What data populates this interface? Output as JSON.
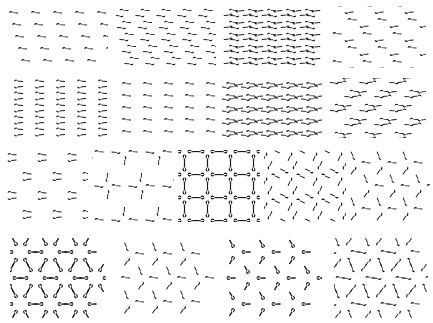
{
  "figure": {
    "title": "",
    "background_color": "#ffffff",
    "ink_color": "#111111",
    "width": 433,
    "height": 323,
    "rows": 4,
    "glyph": {
      "name": "comma-teardrop",
      "head_radius": 1.9,
      "tail_length": 7.0,
      "tail_width": 0.9
    }
  },
  "panels": [
    {
      "id": "p1",
      "name": "panel-p1",
      "label": "p1",
      "row": 0,
      "col": 0,
      "x": 8,
      "y": 6,
      "w": 100,
      "h": 62,
      "lattice": "oblique",
      "cell_w": 22,
      "cell_h": 12,
      "shear": 6,
      "cols": 5,
      "rows": 5,
      "motif": [
        {
          "x": 0,
          "y": 0,
          "rot": 0,
          "flip": 1
        }
      ]
    },
    {
      "id": "p2",
      "name": "panel-p2",
      "label": "p2",
      "row": 0,
      "col": 1,
      "x": 116,
      "y": 6,
      "w": 100,
      "h": 62,
      "lattice": "oblique",
      "cell_w": 21,
      "cell_h": 12,
      "shear": 5,
      "cols": 5,
      "rows": 5,
      "motif": [
        {
          "x": 0,
          "y": -2.4,
          "rot": 0,
          "flip": 1
        },
        {
          "x": 0,
          "y": 2.4,
          "rot": 180,
          "flip": 1
        }
      ]
    },
    {
      "id": "pm",
      "name": "panel-pm",
      "label": "pm",
      "row": 0,
      "col": 2,
      "x": 222,
      "y": 6,
      "w": 100,
      "h": 62,
      "lattice": "rect",
      "cell_w": 19,
      "cell_h": 12,
      "shear": 0,
      "cols": 5,
      "rows": 5,
      "motif": [
        {
          "x": -3.2,
          "y": -2.4,
          "rot": 0,
          "flip": 1
        },
        {
          "x": 3.2,
          "y": -2.4,
          "rot": 0,
          "flip": -1
        },
        {
          "x": -3.2,
          "y": 2.4,
          "rot": 180,
          "flip": -1
        },
        {
          "x": 3.2,
          "y": 2.4,
          "rot": 180,
          "flip": 1
        }
      ]
    },
    {
      "id": "pg",
      "name": "panel-pg",
      "label": "pg",
      "row": 0,
      "col": 3,
      "x": 330,
      "y": 6,
      "w": 96,
      "h": 62,
      "lattice": "rect-glide",
      "cell_w": 30,
      "cell_h": 14,
      "shear": 15,
      "cols": 3,
      "rows": 5,
      "motif": [
        {
          "x": -6,
          "y": -3,
          "rot": 0,
          "flip": 1
        },
        {
          "x": 6,
          "y": 3,
          "rot": 0,
          "flip": -1
        }
      ]
    },
    {
      "id": "cm",
      "name": "panel-cm",
      "label": "cm",
      "row": 1,
      "col": 0,
      "x": 8,
      "y": 78,
      "w": 100,
      "h": 60,
      "lattice": "rect",
      "cell_w": 21,
      "cell_h": 12,
      "shear": 0,
      "cols": 5,
      "rows": 5,
      "motif": [
        {
          "x": 0,
          "y": -2.6,
          "rot": 0,
          "flip": 1
        },
        {
          "x": 0,
          "y": 2.6,
          "rot": 0,
          "flip": -1
        }
      ]
    },
    {
      "id": "pmm",
      "name": "panel-pmm",
      "label": "pmm",
      "row": 1,
      "col": 1,
      "x": 116,
      "y": 78,
      "w": 100,
      "h": 60,
      "lattice": "rect",
      "cell_w": 21,
      "cell_h": 12,
      "shear": 0,
      "cols": 5,
      "rows": 5,
      "motif": [
        {
          "x": 0,
          "y": 0,
          "rot": 0,
          "flip": 1
        }
      ]
    },
    {
      "id": "pmg",
      "name": "panel-pmg",
      "label": "pmg",
      "row": 1,
      "col": 2,
      "x": 222,
      "y": 78,
      "w": 100,
      "h": 60,
      "lattice": "rect",
      "cell_w": 20,
      "cell_h": 12,
      "shear": 0,
      "cols": 5,
      "rows": 5,
      "motif": [
        {
          "x": -4,
          "y": 0,
          "rot": 0,
          "flip": 1
        },
        {
          "x": 4,
          "y": 0,
          "rot": 0,
          "flip": -1
        },
        {
          "x": -4,
          "y": 3,
          "rot": 180,
          "flip": 1
        },
        {
          "x": 4,
          "y": 3,
          "rot": 180,
          "flip": -1
        }
      ]
    },
    {
      "id": "pgg",
      "name": "panel-pgg",
      "label": "pgg",
      "row": 1,
      "col": 3,
      "x": 330,
      "y": 78,
      "w": 96,
      "h": 60,
      "lattice": "centered",
      "cell_w": 30,
      "cell_h": 14,
      "shear": 15,
      "cols": 3,
      "rows": 5,
      "motif": [
        {
          "x": -4,
          "y": -2.4,
          "rot": 0,
          "flip": 1
        },
        {
          "x": -4,
          "y": 2.4,
          "rot": 180,
          "flip": 1
        },
        {
          "x": 4,
          "y": -2.4,
          "rot": 0,
          "flip": -1
        },
        {
          "x": 4,
          "y": 2.4,
          "rot": 180,
          "flip": -1
        }
      ]
    },
    {
      "id": "cmm",
      "name": "panel-cmm",
      "label": "cmm",
      "row": 2,
      "col": 0,
      "x": 6,
      "y": 150,
      "w": 82,
      "h": 72,
      "lattice": "centered",
      "cell_w": 30,
      "cell_h": 19,
      "shear": 15,
      "cols": 3,
      "rows": 4,
      "motif": [
        {
          "x": 0,
          "y": -2.6,
          "rot": 0,
          "flip": 1
        },
        {
          "x": 0,
          "y": 2.6,
          "rot": 0,
          "flip": -1
        }
      ]
    },
    {
      "id": "p4",
      "name": "panel-p4",
      "label": "p4",
      "row": 2,
      "col": 1,
      "x": 92,
      "y": 150,
      "w": 82,
      "h": 72,
      "lattice": "square",
      "cell_w": 34,
      "cell_h": 34,
      "shear": 17,
      "cols": 3,
      "rows": 3,
      "motif": [
        {
          "x": 0,
          "y": 0,
          "rot": 0,
          "flip": 1,
          "n": 4,
          "r": 6
        }
      ]
    },
    {
      "id": "p4m",
      "name": "panel-p4m",
      "label": "p4m",
      "row": 2,
      "col": 2,
      "x": 178,
      "y": 150,
      "w": 82,
      "h": 72,
      "lattice": "square",
      "cell_w": 23,
      "cell_h": 23,
      "shear": 0,
      "cols": 4,
      "rows": 4,
      "motif": [
        {
          "x": 0,
          "y": 0,
          "rot": 0,
          "flip": 1,
          "n": 4,
          "r": 5,
          "mirror": true
        }
      ]
    },
    {
      "id": "p4g",
      "name": "panel-p4g",
      "label": "p4g",
      "row": 2,
      "col": 3,
      "x": 264,
      "y": 150,
      "w": 82,
      "h": 72,
      "lattice": "square",
      "cell_w": 25,
      "cell_h": 25,
      "shear": 0,
      "cols": 4,
      "rows": 4,
      "motif": [
        {
          "x": 0,
          "y": 0,
          "rot": 20,
          "flip": 1,
          "n": 4,
          "r": 6
        }
      ]
    },
    {
      "id": "p3",
      "name": "panel-p3",
      "label": "p3",
      "row": 2,
      "col": 4,
      "x": 350,
      "y": 150,
      "w": 80,
      "h": 72,
      "lattice": "hex",
      "cell_w": 26,
      "cell_h": 23,
      "shear": 13,
      "cols": 3,
      "rows": 3,
      "motif": [
        {
          "x": 0,
          "y": 0,
          "rot": 0,
          "flip": 1,
          "n": 3,
          "r": 6
        }
      ]
    },
    {
      "id": "p6m",
      "name": "panel-p6m",
      "label": "p6m",
      "row": 3,
      "col": 0,
      "x": 10,
      "y": 236,
      "w": 96,
      "h": 84,
      "lattice": "hex-rosette",
      "cell_w": 30,
      "cell_h": 26,
      "shear": 15,
      "cols": 3,
      "rows": 3,
      "motif": [
        {
          "x": 0,
          "y": 0,
          "rot": 0,
          "flip": 1,
          "n": 6,
          "r": 9,
          "mirror": true
        }
      ]
    },
    {
      "id": "p6",
      "name": "panel-p6",
      "label": "p6",
      "row": 3,
      "col": 1,
      "x": 118,
      "y": 236,
      "w": 96,
      "h": 84,
      "lattice": "hex-rosette",
      "cell_w": 28,
      "cell_h": 24,
      "shear": 14,
      "cols": 3,
      "rows": 3,
      "motif": [
        {
          "x": 0,
          "y": 0,
          "rot": 0,
          "flip": 1,
          "n": 3,
          "r": 6
        }
      ]
    },
    {
      "id": "p31m",
      "name": "panel-p31m",
      "label": "p31m",
      "row": 3,
      "col": 2,
      "x": 226,
      "y": 236,
      "w": 96,
      "h": 84,
      "lattice": "hex-rosette",
      "cell_w": 30,
      "cell_h": 26,
      "shear": 15,
      "cols": 3,
      "rows": 3,
      "motif": [
        {
          "x": 0,
          "y": 0,
          "rot": 0,
          "flip": 1,
          "n": 3,
          "r": 7,
          "mirror": true
        }
      ]
    },
    {
      "id": "p3m1",
      "name": "panel-p3m1",
      "label": "p3m1",
      "row": 3,
      "col": 3,
      "x": 334,
      "y": 236,
      "w": 94,
      "h": 84,
      "lattice": "hex-rosette",
      "cell_w": 30,
      "cell_h": 26,
      "shear": 15,
      "cols": 3,
      "rows": 3,
      "motif": [
        {
          "x": 0,
          "y": 0,
          "rot": 0,
          "flip": 1,
          "n": 6,
          "r": 9
        }
      ]
    }
  ]
}
